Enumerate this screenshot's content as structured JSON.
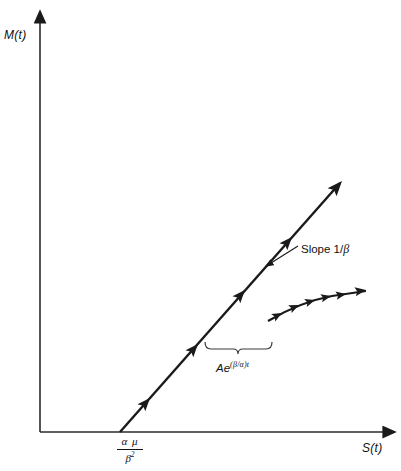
{
  "figure": {
    "type": "line-diagram",
    "background_color": "#ffffff",
    "stroke_color": "#1a1a1a",
    "axes": {
      "y_axis_label": "M(t)",
      "x_axis_label": "S(t)",
      "origin": [
        40,
        432
      ],
      "x_axis_end": [
        392,
        432
      ],
      "y_axis_end": [
        40,
        14
      ]
    },
    "annotations": {
      "slope_label_prefix": "Slope 1/",
      "slope_label_symbol": "β",
      "growth_base": "Ae",
      "growth_exponent": "(β/α)t",
      "intercept_numerator": "α μ",
      "intercept_denominator": "β",
      "intercept_denominator_exponent": "2"
    },
    "series": [
      {
        "name": "asymptotic-line",
        "description": "straight line with slope 1/beta, arrowheads along path",
        "start": [
          120,
          432
        ],
        "end": [
          342,
          181
        ],
        "arrowhead_positions": [
          [
            148,
            400
          ],
          [
            196,
            346
          ],
          [
            243,
            292
          ],
          [
            290,
            238
          ],
          [
            342,
            181
          ]
        ]
      },
      {
        "name": "transient-curve",
        "description": "concave-down arc of small arrowheads below the line",
        "start": [
          268,
          321
        ],
        "end": [
          366,
          291
        ],
        "arrowhead_count": 7
      }
    ],
    "brace": {
      "left": 205,
      "right": 272,
      "y": 349,
      "points": "down"
    },
    "pointer_arrow": {
      "from": [
        299,
        245
      ],
      "to": [
        270,
        263
      ]
    }
  }
}
